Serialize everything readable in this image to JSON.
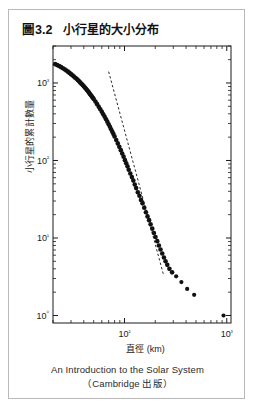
{
  "figure": {
    "number": "圖3.2",
    "title": "小行星的大小分布",
    "source_line_1": "An Introduction to the Solar System",
    "source_line_2": "（Cambridge 出版）",
    "border_color": "#b9b9b9",
    "text_color": "#111111"
  },
  "chart_data": {
    "type": "scatter",
    "title": "小行星的大小分布",
    "xlabel": "直徑 (km)",
    "ylabel": "小行星的累計數量",
    "xscale": "log",
    "yscale": "log",
    "xlim": [
      20,
      1100
    ],
    "ylim": [
      0.8,
      3000
    ],
    "grid": false,
    "legend": null,
    "marker_color": "#111111",
    "x_major_ticks": [
      "10²",
      "10³"
    ],
    "x_major_values": [
      100,
      1000
    ],
    "y_major_ticks": [
      "10⁰",
      "10¹",
      "10²",
      "10³"
    ],
    "y_major_values": [
      1,
      10,
      100,
      1000
    ],
    "annotations": [
      {
        "name": "power-law-reference-line",
        "style": "dashed",
        "x_start": 70,
        "y_start": 1400,
        "x_end": 240,
        "y_end": 3.4
      }
    ],
    "points": [
      {
        "x": 21,
        "y": 1750
      },
      {
        "x": 22,
        "y": 1700
      },
      {
        "x": 23,
        "y": 1650
      },
      {
        "x": 24,
        "y": 1600
      },
      {
        "x": 25,
        "y": 1550
      },
      {
        "x": 26,
        "y": 1500
      },
      {
        "x": 27,
        "y": 1450
      },
      {
        "x": 28,
        "y": 1400
      },
      {
        "x": 29,
        "y": 1350
      },
      {
        "x": 30,
        "y": 1300
      },
      {
        "x": 31,
        "y": 1255
      },
      {
        "x": 32,
        "y": 1210
      },
      {
        "x": 33,
        "y": 1170
      },
      {
        "x": 34,
        "y": 1130
      },
      {
        "x": 35,
        "y": 1090
      },
      {
        "x": 36,
        "y": 1050
      },
      {
        "x": 37,
        "y": 1010
      },
      {
        "x": 38,
        "y": 975
      },
      {
        "x": 39,
        "y": 940
      },
      {
        "x": 40,
        "y": 905
      },
      {
        "x": 41,
        "y": 872
      },
      {
        "x": 42,
        "y": 840
      },
      {
        "x": 43,
        "y": 810
      },
      {
        "x": 44,
        "y": 780
      },
      {
        "x": 45,
        "y": 750
      },
      {
        "x": 46,
        "y": 722
      },
      {
        "x": 47,
        "y": 695
      },
      {
        "x": 48,
        "y": 670
      },
      {
        "x": 49,
        "y": 645
      },
      {
        "x": 50,
        "y": 620
      },
      {
        "x": 52,
        "y": 575
      },
      {
        "x": 54,
        "y": 533
      },
      {
        "x": 56,
        "y": 494
      },
      {
        "x": 58,
        "y": 458
      },
      {
        "x": 60,
        "y": 425
      },
      {
        "x": 62,
        "y": 394
      },
      {
        "x": 64,
        "y": 366
      },
      {
        "x": 66,
        "y": 340
      },
      {
        "x": 68,
        "y": 316
      },
      {
        "x": 70,
        "y": 293
      },
      {
        "x": 72,
        "y": 272
      },
      {
        "x": 74,
        "y": 253
      },
      {
        "x": 76,
        "y": 235
      },
      {
        "x": 78,
        "y": 219
      },
      {
        "x": 80,
        "y": 204
      },
      {
        "x": 83,
        "y": 184
      },
      {
        "x": 86,
        "y": 166
      },
      {
        "x": 89,
        "y": 150
      },
      {
        "x": 92,
        "y": 136
      },
      {
        "x": 95,
        "y": 123
      },
      {
        "x": 98,
        "y": 112
      },
      {
        "x": 101,
        "y": 101
      },
      {
        "x": 104,
        "y": 92
      },
      {
        "x": 107,
        "y": 84
      },
      {
        "x": 110,
        "y": 76
      },
      {
        "x": 114,
        "y": 68
      },
      {
        "x": 118,
        "y": 61
      },
      {
        "x": 122,
        "y": 55
      },
      {
        "x": 126,
        "y": 49
      },
      {
        "x": 130,
        "y": 44
      },
      {
        "x": 135,
        "y": 39
      },
      {
        "x": 140,
        "y": 35
      },
      {
        "x": 145,
        "y": 31
      },
      {
        "x": 150,
        "y": 28
      },
      {
        "x": 156,
        "y": 24.5
      },
      {
        "x": 162,
        "y": 21.5
      },
      {
        "x": 168,
        "y": 19
      },
      {
        "x": 174,
        "y": 17
      },
      {
        "x": 180,
        "y": 15
      },
      {
        "x": 187,
        "y": 13.2
      },
      {
        "x": 194,
        "y": 11.6
      },
      {
        "x": 201,
        "y": 10.3
      },
      {
        "x": 209,
        "y": 9.1
      },
      {
        "x": 217,
        "y": 8.0
      },
      {
        "x": 225,
        "y": 7.1
      },
      {
        "x": 234,
        "y": 6.3
      },
      {
        "x": 243,
        "y": 5.6
      },
      {
        "x": 252,
        "y": 5.0
      },
      {
        "x": 262,
        "y": 4.5
      },
      {
        "x": 275,
        "y": 4.0
      },
      {
        "x": 292,
        "y": 3.6
      },
      {
        "x": 320,
        "y": 3.2
      },
      {
        "x": 360,
        "y": 2.7
      },
      {
        "x": 410,
        "y": 2.2
      },
      {
        "x": 480,
        "y": 1.85
      },
      {
        "x": 930,
        "y": 1.0
      }
    ]
  }
}
